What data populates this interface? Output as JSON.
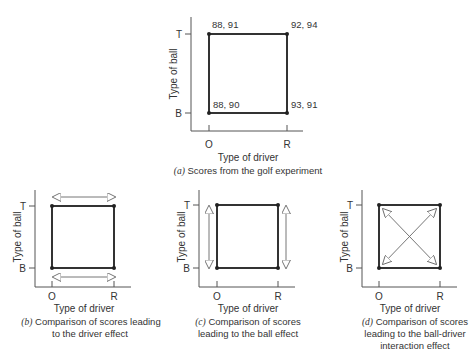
{
  "panel_a": {
    "x_axis_label": "Type of driver",
    "y_axis_label": "Type of ball",
    "x_ticks": [
      "O",
      "R"
    ],
    "y_ticks": [
      "T",
      "B"
    ],
    "points": {
      "OT": "88, 91",
      "RT": "92, 94",
      "OB": "88, 90",
      "RB": "93, 91"
    },
    "caption_letter": "(a)",
    "caption_text": " Scores from the golf experiment"
  },
  "panel_b": {
    "x_axis_label": "Type of driver",
    "y_axis_label": "Type of ball",
    "x_ticks": [
      "O",
      "R"
    ],
    "y_ticks": [
      "T",
      "B"
    ],
    "caption_letter": "(b)",
    "caption_line1": " Comparison of scores leading",
    "caption_line2": "to the driver effect"
  },
  "panel_c": {
    "x_axis_label": "Type of driver",
    "y_axis_label": "Type of ball",
    "x_ticks": [
      "O",
      "R"
    ],
    "y_ticks": [
      "T",
      "B"
    ],
    "caption_letter": "(c)",
    "caption_line1": " Comparison of scores",
    "caption_line2": "leading to the ball effect"
  },
  "panel_d": {
    "x_axis_label": "Type of driver",
    "y_axis_label": "Type of ball",
    "x_ticks": [
      "O",
      "R"
    ],
    "y_ticks": [
      "T",
      "B"
    ],
    "caption_letter": "(d)",
    "caption_line1": " Comparison of scores",
    "caption_line2": "leading to the ball-driver",
    "caption_line3": "interaction effect"
  }
}
